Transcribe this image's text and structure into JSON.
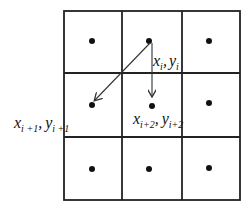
{
  "diagram": {
    "grid": {
      "rows": 3,
      "cols": 3
    },
    "points": [
      {
        "id": "p_i",
        "label_x": "x",
        "label_x_sub": "i",
        "label_y": "y",
        "label_y_sub": "i",
        "sep": ","
      },
      {
        "id": "p_i1",
        "label_x": "x",
        "label_x_sub": "i +1",
        "label_y": "y",
        "label_y_sub": "i +1",
        "sep": ","
      },
      {
        "id": "p_i2",
        "label_x": "x",
        "label_x_sub": "i+2",
        "label_y": "y",
        "label_y_sub": "i+2",
        "sep": ","
      }
    ],
    "colors": {
      "line": "#222222",
      "dot": "#111111",
      "arrow": "#333333"
    }
  }
}
